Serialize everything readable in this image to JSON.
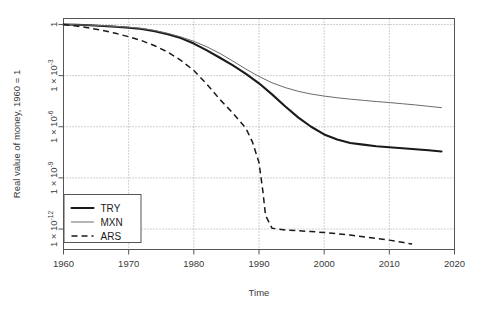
{
  "chart_data": {
    "type": "line",
    "title": "",
    "xlabel": "Time",
    "ylabel": "Real value of money, 1960 = 1",
    "xlim": [
      1960,
      2020
    ],
    "ylim_log10": [
      -13.2,
      0.35
    ],
    "grid": true,
    "legend_position": "bottom-left",
    "xticks": [
      1960,
      1970,
      1980,
      1990,
      2000,
      2010,
      2020
    ],
    "xtick_labels": [
      "1960",
      "1970",
      "1980",
      "1990",
      "2000",
      "2010",
      "2020"
    ],
    "yticks_log10": [
      0,
      -3,
      -6,
      -9,
      -12
    ],
    "ytick_labels": [
      "1",
      "1 × 10",
      "1 × 10",
      "1 × 10",
      "1 × 10"
    ],
    "ytick_exponents": [
      "",
      "-3",
      "-6",
      "-9",
      "-12"
    ],
    "series": [
      {
        "name": "TRY",
        "style": "solid-thick",
        "color": "#1a1a1a",
        "x": [
          1960,
          1962,
          1964,
          1966,
          1968,
          1970,
          1972,
          1974,
          1976,
          1978,
          1980,
          1982,
          1984,
          1986,
          1988,
          1990,
          1992,
          1994,
          1996,
          1998,
          2000,
          2002,
          2004,
          2006,
          2008,
          2010,
          2012,
          2014,
          2016,
          2018
        ],
        "y_log10": [
          0,
          -0.02,
          -0.05,
          -0.09,
          -0.13,
          -0.19,
          -0.27,
          -0.4,
          -0.57,
          -0.8,
          -1.12,
          -1.52,
          -1.95,
          -2.4,
          -2.9,
          -3.45,
          -4.1,
          -4.8,
          -5.45,
          -6.0,
          -6.45,
          -6.75,
          -6.95,
          -7.05,
          -7.14,
          -7.2,
          -7.26,
          -7.32,
          -7.38,
          -7.45
        ]
      },
      {
        "name": "MXN",
        "style": "solid-thin",
        "color": "#6b6b6b",
        "x": [
          1960,
          1962,
          1964,
          1966,
          1968,
          1970,
          1972,
          1974,
          1976,
          1978,
          1980,
          1982,
          1984,
          1986,
          1988,
          1990,
          1992,
          1994,
          1996,
          1998,
          2000,
          2002,
          2004,
          2006,
          2008,
          2010,
          2012,
          2014,
          2016,
          2018
        ],
        "y_log10": [
          0,
          -0.02,
          -0.04,
          -0.07,
          -0.11,
          -0.16,
          -0.23,
          -0.35,
          -0.52,
          -0.73,
          -0.99,
          -1.31,
          -1.7,
          -2.15,
          -2.62,
          -3.05,
          -3.42,
          -3.7,
          -3.92,
          -4.08,
          -4.2,
          -4.3,
          -4.38,
          -4.45,
          -4.52,
          -4.58,
          -4.65,
          -4.72,
          -4.8,
          -4.88
        ]
      },
      {
        "name": "ARS",
        "style": "dashed",
        "color": "#1a1a1a",
        "x": [
          1960,
          1962,
          1964,
          1966,
          1968,
          1970,
          1972,
          1974,
          1976,
          1978,
          1980,
          1982,
          1984,
          1986,
          1988,
          1989,
          1990,
          1990.6,
          1991,
          1992,
          1994,
          1996,
          1998,
          2000,
          2002,
          2004,
          2006,
          2008,
          2010,
          2012,
          2013.5
        ],
        "y_log10": [
          0,
          -0.09,
          -0.21,
          -0.35,
          -0.52,
          -0.72,
          -0.95,
          -1.25,
          -1.62,
          -2.1,
          -2.7,
          -3.5,
          -4.4,
          -5.2,
          -6.1,
          -6.9,
          -8.1,
          -9.8,
          -11.2,
          -11.95,
          -12.05,
          -12.1,
          -12.15,
          -12.2,
          -12.28,
          -12.35,
          -12.45,
          -12.55,
          -12.65,
          -12.78,
          -12.88
        ]
      }
    ],
    "legend": [
      {
        "label": "TRY",
        "style": "solid-thick"
      },
      {
        "label": "MXN",
        "style": "solid-thin"
      },
      {
        "label": "ARS",
        "style": "dashed"
      }
    ]
  }
}
